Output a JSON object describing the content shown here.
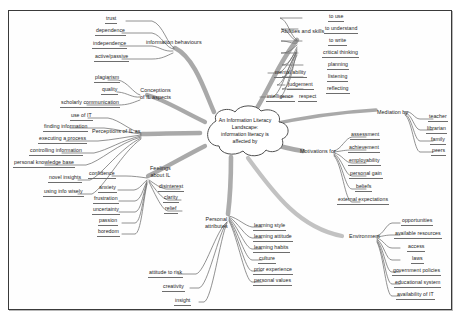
{
  "diagram": {
    "type": "mind-map",
    "center": {
      "label": "An Information Literacy Landscape:\ninformation literacy is\naffected  by",
      "shape": "cloud"
    },
    "branches": [
      {
        "id": "information-behaviours",
        "label": "information behaviours",
        "children": [
          "trust",
          "dependence",
          "independence",
          "active/passive"
        ]
      },
      {
        "id": "conceptions-of-il-aspects",
        "label": "Conceptions\nof IL aspects",
        "children": [
          "plagiarism",
          "quality",
          "scholarly communication"
        ]
      },
      {
        "id": "perceptions-of-il-as",
        "label": "Perceptions of IL as",
        "children": [
          "use of IT",
          "finding information",
          "executing a process",
          "controlling information",
          "personal knowledge base",
          "novel insights",
          "using info wisely"
        ]
      },
      {
        "id": "feelings-about-il",
        "label": "Feelings\nabout IL",
        "children": [
          "confidence",
          "anxiety",
          "frustration",
          "uncertainty",
          "passion",
          "boredom",
          "disinterest",
          "clarity",
          "relief"
        ]
      },
      {
        "id": "personal-attributes",
        "label": "Personal\nattributes",
        "children": [
          "learning style",
          "learning attitude",
          "learning habits",
          "culture",
          "prior experience",
          "personal values",
          "attitude to risk",
          "creativity",
          "insight"
        ]
      },
      {
        "id": "abilities-and-skills",
        "label": "Abilities and skills",
        "children": [
          "to use",
          "to understand",
          "to write",
          "critical thinking",
          "planning",
          "listening",
          "reflecting",
          "mental ability",
          "judgement",
          "intelligence",
          "respect"
        ]
      },
      {
        "id": "mediation-by",
        "label": "Mediation by",
        "children": [
          "teacher",
          "librarian",
          "family",
          "peers"
        ]
      },
      {
        "id": "motivations-for",
        "label": "Motivations for",
        "children": [
          "assessment",
          "achievement",
          "employability",
          "personal gain",
          "beliefs",
          "external expectations"
        ]
      },
      {
        "id": "environment",
        "label": "Environment",
        "children": [
          "opportunities",
          "available resources",
          "access",
          "laws",
          "government policies",
          "educational system",
          "availability of IT"
        ]
      }
    ],
    "colors": {
      "branch_stroke": "#8e8e8e",
      "twig_stroke": "#6d6d6d",
      "text": "#1d1d1d",
      "frame": "#3a3a3a",
      "background": "#ffffff"
    }
  },
  "labels": {
    "trust": "trust",
    "dependence": "dependence",
    "independence": "independence",
    "active_passive": "active/passive",
    "information_behaviours": "information behaviours",
    "plagiarism": "plagiarism",
    "quality": "quality",
    "scholarly_communication": "scholarly communication",
    "conceptions": "Conceptions\nof IL aspects",
    "use_of_it": "use of IT",
    "finding_information": "finding information",
    "executing_a_process": "executing a process",
    "controlling_information": "controlling information",
    "personal_knowledge_base": "personal knowledge base",
    "novel_insights": "novel insights",
    "using_info_wisely": "using info wisely",
    "perceptions": "Perceptions of IL as",
    "confidence": "confidence",
    "anxiety": "anxiety",
    "frustration": "frustration",
    "uncertainty": "uncertainty",
    "passion": "passion",
    "boredom": "boredom",
    "disinterest": "disinterest",
    "clarity": "clarity",
    "relief": "relief",
    "feelings": "Feelings\nabout IL",
    "personal_attributes": "Personal\nattributes",
    "learning_style": "learning style",
    "learning_attitude": "learning attitude",
    "learning_habits": "learning habits",
    "culture": "culture",
    "prior_experience": "prior experience",
    "personal_values": "personal values",
    "attitude_to_risk": "attitude to risk",
    "creativity": "creativity",
    "insight": "insight",
    "abilities_and_skills": "Abilities and skills",
    "to_use": "to use",
    "to_understand": "to understand",
    "to_write": "to write",
    "critical_thinking": "critical thinking",
    "planning": "planning",
    "listening": "listening",
    "reflecting": "reflecting",
    "mental_ability": "mental ability",
    "judgement": "judgement",
    "intelligence": "intelligence",
    "respect": "respect",
    "mediation_by": "Mediation by",
    "teacher": "teacher",
    "librarian": "librarian",
    "family": "family",
    "peers": "peers",
    "motivations_for": "Motivations for",
    "assessment": "assessment",
    "achievement": "achievement",
    "employability": "employability",
    "personal_gain": "personal gain",
    "beliefs": "beliefs",
    "external_expectations": "external expectations",
    "environment": "Environment",
    "opportunities": "opportunities",
    "available_resources": "available resources",
    "access": "access",
    "laws": "laws",
    "government_policies": "government policies",
    "educational_system": "educational system",
    "availability_of_it": "availability of IT",
    "center": "An Information Literacy Landscape:\ninformation literacy is\naffected  by"
  }
}
